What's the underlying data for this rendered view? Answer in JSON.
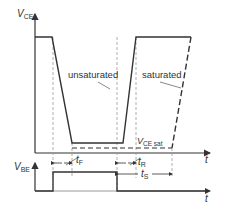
{
  "diagram": {
    "type": "timing-diagram",
    "top_plot": {
      "y_axis_label": "V",
      "y_axis_subscript": "CE",
      "x_axis_label": "t",
      "curves": [
        {
          "name": "unsaturated",
          "label": "unsaturated",
          "style": "solid"
        },
        {
          "name": "saturated",
          "label": "saturated",
          "style": "dashed"
        }
      ],
      "level_label": "V",
      "level_subscript": "CE sat"
    },
    "bottom_plot": {
      "y_axis_label": "V",
      "y_axis_subscript": "BE",
      "x_axis_label": "t"
    },
    "intervals": [
      {
        "name": "fall-time",
        "label": "t",
        "subscript": "F"
      },
      {
        "name": "rise-time",
        "label": "t",
        "subscript": "R"
      },
      {
        "name": "storage-time",
        "label": "t",
        "subscript": "S"
      }
    ],
    "colors": {
      "line": "#333333",
      "guide": "#999999",
      "background": "#ffffff"
    }
  }
}
